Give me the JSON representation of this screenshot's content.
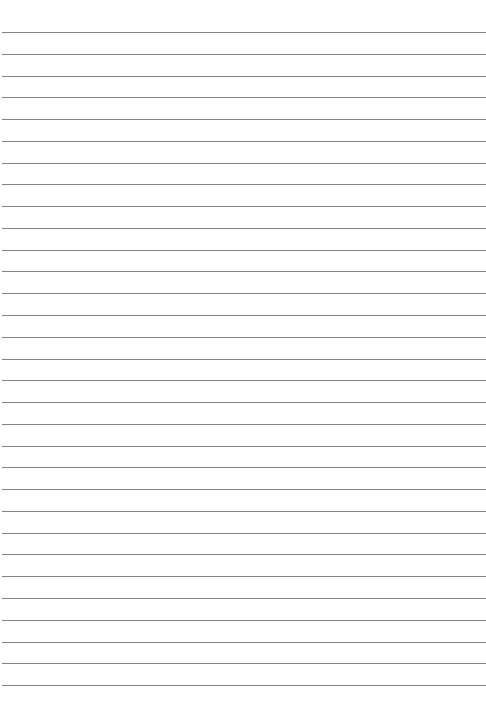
{
  "sheet": {
    "type": "lined-paper",
    "background_color": "#ffffff",
    "line_color": "#6f6f6f",
    "line_count": 31,
    "first_line_y": 32,
    "line_spacing": 21.77,
    "line_left_x": 2
  }
}
